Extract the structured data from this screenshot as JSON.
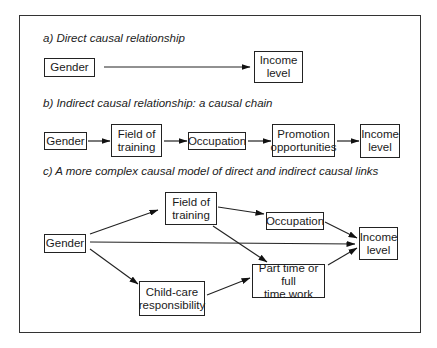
{
  "sections": {
    "a": {
      "title": "a) Direct causal relationship",
      "nodes": {
        "gender": "Gender",
        "income": "Income\nlevel"
      }
    },
    "b": {
      "title": "b) Indirect causal relationship: a causal chain",
      "nodes": {
        "gender": "Gender",
        "field": "Field of\ntraining",
        "occupation": "Occupation",
        "promotion": "Promotion\nopportunities",
        "income": "Income\nlevel"
      }
    },
    "c": {
      "title": "c) A more complex causal model of direct and indirect causal links",
      "nodes": {
        "gender": "Gender",
        "field": "Field of\ntraining",
        "occupation": "Occupation",
        "income": "Income\nlevel",
        "parttime": "Part time or full\ntime work",
        "childcare": "Child-care\nresponsibility"
      }
    }
  },
  "edges": {
    "a": [
      [
        "Gender",
        "Income level"
      ]
    ],
    "b": [
      [
        "Gender",
        "Field of training"
      ],
      [
        "Field of training",
        "Occupation"
      ],
      [
        "Occupation",
        "Promotion opportunities"
      ],
      [
        "Promotion opportunities",
        "Income level"
      ]
    ],
    "c": [
      [
        "Gender",
        "Field of training"
      ],
      [
        "Gender",
        "Income level"
      ],
      [
        "Gender",
        "Child-care responsibility"
      ],
      [
        "Field of training",
        "Occupation"
      ],
      [
        "Field of training",
        "Part time or full time work"
      ],
      [
        "Occupation",
        "Income level"
      ],
      [
        "Child-care responsibility",
        "Part time or full time work"
      ],
      [
        "Part time or full time work",
        "Income level"
      ]
    ]
  }
}
